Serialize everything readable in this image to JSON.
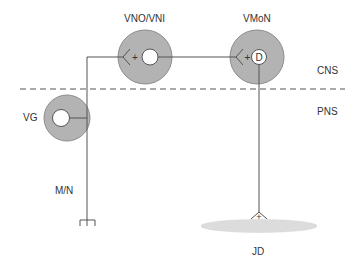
{
  "diagram": {
    "labels": {
      "vno_vni": "VNO/VNI",
      "vmon": "VMoN",
      "vg": "VG",
      "cns": "CNS",
      "pns": "PNS",
      "mn": "M/N",
      "jd": "JD",
      "d_symbol": "D",
      "plus_symbol": "+"
    },
    "colors": {
      "neuron_fill": "#b3b3b3",
      "neuron_stroke": "#8c8c8c",
      "line": "#555555",
      "jd_fill": "#dcdcdc",
      "dash": "#555555"
    },
    "nodes": [
      {
        "id": "vno_vni",
        "label": "VNO/VNI",
        "cx": 145,
        "cy": 57,
        "r": 27
      },
      {
        "id": "vmon",
        "label": "VMoN",
        "cx": 257,
        "cy": 57,
        "r": 27
      },
      {
        "id": "vg",
        "label": "VG",
        "cx": 67,
        "cy": 118,
        "r": 23
      }
    ],
    "boundary": {
      "label_above": "CNS",
      "label_below": "PNS",
      "y": 89
    }
  }
}
